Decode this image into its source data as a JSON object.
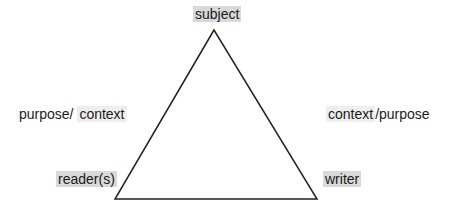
{
  "diagram": {
    "type": "rhetorical-triangle",
    "colors": {
      "line": "#222222",
      "highlight": "#d9d9d9",
      "highlight_light": "#eeeeee",
      "text": "#1a1a1a"
    },
    "vertices": {
      "top": "subject",
      "bottom_left": "reader(s)",
      "bottom_right": "writer"
    },
    "sides": {
      "left": {
        "prefix": "purpose/ ",
        "highlighted": "context"
      },
      "right": {
        "highlighted": "context",
        "suffix": "/purpose"
      }
    }
  }
}
